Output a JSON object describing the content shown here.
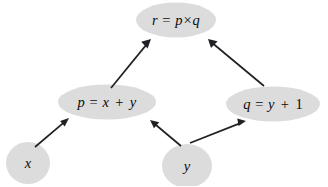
{
  "diagram": {
    "kind": "dataflow-dependency-graph",
    "background_color": "#ffffff",
    "node_fill_color": "#dcdcdc",
    "edge_color": "#222024",
    "text_color": "#0b0b0d",
    "nodes": [
      {
        "id": "r",
        "name": "node-r",
        "shape": "ellipse",
        "label": "r = p×q",
        "variable": "r",
        "operator": "×",
        "operands": [
          "p",
          "q"
        ],
        "cx": 176,
        "cy": 20,
        "rx": 40,
        "ry": 17.5
      },
      {
        "id": "p",
        "name": "node-p",
        "shape": "ellipse",
        "label": "p = x + y",
        "variable": "p",
        "operator": "+",
        "operands": [
          "x",
          "y"
        ],
        "cx": 107,
        "cy": 102,
        "rx": 49,
        "ry": 17.5
      },
      {
        "id": "q",
        "name": "node-q",
        "shape": "ellipse",
        "label": "q = y + 1",
        "variable": "q",
        "operator": "+",
        "operands": [
          "y",
          "1"
        ],
        "cx": 273,
        "cy": 104,
        "rx": 47,
        "ry": 17.5
      },
      {
        "id": "x",
        "name": "node-x",
        "shape": "circle",
        "label": "x",
        "variable": "x",
        "operator": "",
        "operands": [],
        "cx": 28,
        "cy": 163,
        "rx": 22,
        "ry": 21
      },
      {
        "id": "y",
        "name": "node-y",
        "shape": "circle",
        "label": "y",
        "variable": "y",
        "operator": "",
        "operands": [],
        "cx": 187,
        "cy": 166,
        "rx": 25,
        "ry": 22
      }
    ],
    "edges": [
      {
        "id": "x-to-p",
        "name": "edge-x-to-p",
        "from": "x",
        "to": "p",
        "x1": 35,
        "y1": 147,
        "x2": 69,
        "y2": 118
      },
      {
        "id": "y-to-p",
        "name": "edge-y-to-p",
        "from": "y",
        "to": "p",
        "x1": 181,
        "y1": 146,
        "x2": 150,
        "y2": 120
      },
      {
        "id": "y-to-q",
        "name": "edge-y-to-q",
        "from": "y",
        "to": "q",
        "x1": 190,
        "y1": 143,
        "x2": 246,
        "y2": 121
      },
      {
        "id": "p-to-r",
        "name": "edge-p-to-r",
        "from": "p",
        "to": "r",
        "x1": 111,
        "y1": 88,
        "x2": 151,
        "y2": 39
      },
      {
        "id": "q-to-r",
        "name": "edge-q-to-r",
        "from": "q",
        "to": "r",
        "x1": 264,
        "y1": 86,
        "x2": 208,
        "y2": 39
      }
    ]
  }
}
